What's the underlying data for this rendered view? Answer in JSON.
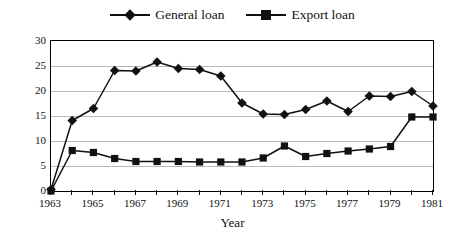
{
  "chart_data": {
    "type": "line",
    "title": "",
    "xlabel": "Year",
    "ylabel": "",
    "x": [
      1963,
      1964,
      1965,
      1966,
      1967,
      1968,
      1969,
      1970,
      1971,
      1972,
      1973,
      1974,
      1975,
      1976,
      1977,
      1978,
      1979,
      1980,
      1981
    ],
    "series": [
      {
        "name": "General loan",
        "marker": "diamond",
        "color": "#111111",
        "values": [
          0.3,
          14.1,
          16.5,
          24.1,
          24.0,
          25.8,
          24.5,
          24.3,
          23.0,
          17.6,
          15.4,
          15.3,
          16.3,
          18.0,
          15.9,
          19.0,
          18.9,
          19.9,
          17.0
        ]
      },
      {
        "name": "Export loan",
        "marker": "square",
        "color": "#111111",
        "values": [
          0.0,
          8.1,
          7.7,
          6.5,
          5.9,
          5.9,
          5.9,
          5.8,
          5.8,
          5.8,
          6.6,
          9.0,
          6.9,
          7.5,
          8.0,
          8.4,
          8.9,
          14.8,
          14.8
        ]
      }
    ],
    "ylim": [
      0,
      30
    ],
    "ytick_labels": [
      "0",
      "5",
      "10",
      "15",
      "20",
      "25",
      "30"
    ],
    "yticks": [
      0,
      5,
      10,
      15,
      20,
      25,
      30
    ],
    "xlim": [
      1963,
      1981
    ],
    "xtick_labels": [
      "1963",
      "1965",
      "1967",
      "1969",
      "1971",
      "1973",
      "1975",
      "1977",
      "1979",
      "1981"
    ],
    "xticks": [
      1963,
      1965,
      1967,
      1969,
      1971,
      1973,
      1975,
      1977,
      1979,
      1981
    ],
    "xtick_minor": [
      1964,
      1966,
      1968,
      1970,
      1972,
      1974,
      1976,
      1978,
      1980
    ],
    "grid": "horizontal",
    "legend_position": "top-center"
  }
}
